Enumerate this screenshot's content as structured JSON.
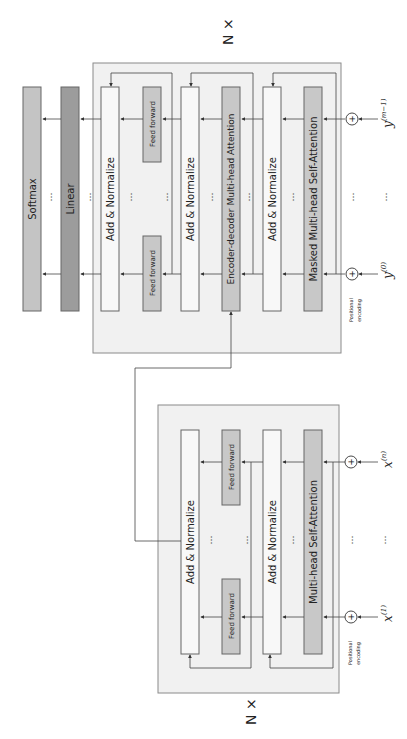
{
  "colors": {
    "background": "#ffffff",
    "panel_fill": "#f1f1f1",
    "panel_stroke": "#8a8a8a",
    "block_white": "#f8f8f8",
    "block_gray": "#c8c8c8",
    "linear_fill": "#9c9c9c",
    "softmax_fill": "#c4c4c4",
    "line": "#444444"
  },
  "decoder": {
    "repeat_label": "N ×",
    "softmax": "Softmax",
    "linear": "Linear",
    "add_norm_top": "Add & Normalize",
    "feed_forward_left": "Feed forward",
    "feed_forward_right": "Feed forward",
    "add_norm_mid": "Add & Normalize",
    "enc_dec_attention": "Encoder-decoder Multi-head Attention",
    "add_norm_bottom": "Add & Normalize",
    "masked_attention": "Masked Multi-head Self-Attention",
    "positional_encoding": [
      "Positional",
      "encoding"
    ],
    "plus": "+",
    "input_first": "y",
    "input_first_sup": "(0)",
    "input_last": "y",
    "input_last_sup": "(m−1)",
    "ellipsis": "⋯"
  },
  "encoder": {
    "repeat_label": "N ×",
    "add_norm_top": "Add & Normalize",
    "feed_forward_left": "Feed forward",
    "feed_forward_right": "Feed forward",
    "add_norm_bottom": "Add & Normalize",
    "self_attention": "Multi-head Self-Attention",
    "positional_encoding": [
      "Positional",
      "encoding"
    ],
    "plus": "+",
    "input_first": "x",
    "input_first_sup": "(1)",
    "input_last": "x",
    "input_last_sup": "(n)",
    "ellipsis": "⋯"
  }
}
